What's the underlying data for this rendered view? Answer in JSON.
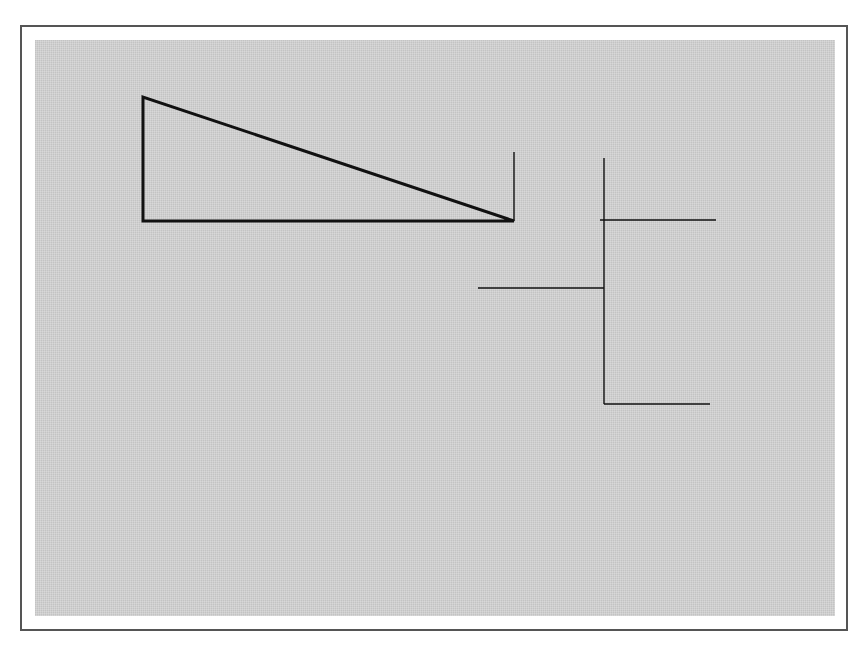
{
  "figure": {
    "type": "3D wireframe scene",
    "background_color": "#cfcfcf",
    "line_color": "#111111",
    "frame_color": "#555555"
  },
  "labels": {
    "world_z": "z",
    "upper_y": "y",
    "upper_x": "x",
    "upper_x_left": "x",
    "lower_y": "y",
    "lower_x": "x"
  },
  "objects": [
    {
      "name": "cone-triangle",
      "kind": "triangle"
    },
    {
      "name": "upper-solid",
      "kind": "hexagonal double pyramid wireframe"
    },
    {
      "name": "lower-solid",
      "kind": "faceted sphere wireframe"
    }
  ]
}
